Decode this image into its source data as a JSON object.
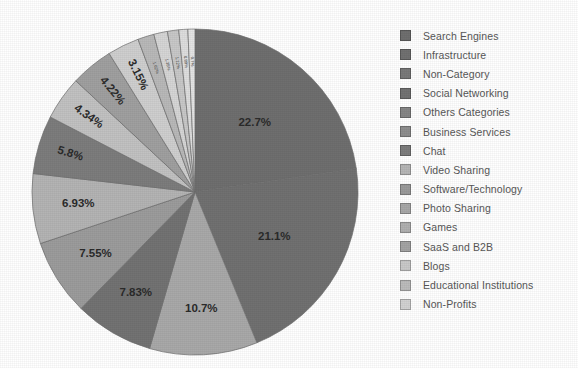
{
  "chart_data": {
    "type": "pie",
    "title": "",
    "xlabel": "",
    "ylabel": "",
    "legend_position": "right",
    "grid": false,
    "start_angle_deg": -90,
    "direction": "clockwise",
    "categories": [
      "Search Engines",
      "Infrastructure",
      "Non-Category",
      "Social Networking",
      "Others Categories",
      "Business Services",
      "Chat",
      "Video Sharing",
      "Software/Technology",
      "Photo Sharing",
      "Games",
      "SaaS and B2B",
      "Blogs",
      "Educational Institutions",
      "Non-Profits"
    ],
    "values": [
      22.7,
      21.1,
      10.7,
      7.83,
      7.55,
      6.93,
      5.8,
      4.34,
      4.22,
      3.15,
      1.62,
      1.35,
      1.12,
      0.89,
      0.7
    ],
    "labels": [
      "22.7%",
      "21.1%",
      "10.7%",
      "7.83%",
      "7.55%",
      "6.93%",
      "5.8%",
      "4.34%",
      "4.22%",
      "3.15%",
      "1.62%",
      "1.35%",
      "1.12%",
      "0.89%",
      "0.7%"
    ],
    "colors": [
      "#6f6f6f",
      "#717171",
      "#a9a9a9",
      "#737373",
      "#9c9c9c",
      "#b4b4b4",
      "#7d7d7d",
      "#c2c2c2",
      "#a0a0a0",
      "#cfcfcf",
      "#b9b9b9",
      "#d6d6d6",
      "#c8c8c8",
      "#dedede",
      "#e4e4e4"
    ],
    "slice_label_visible": [
      true,
      true,
      true,
      true,
      true,
      true,
      true,
      true,
      true,
      true,
      false,
      false,
      false,
      false,
      false
    ]
  },
  "legend": {
    "items": [
      {
        "label": "Search Engines",
        "color": "#6f6f6f"
      },
      {
        "label": "Infrastructure",
        "color": "#717171"
      },
      {
        "label": "Non-Category",
        "color": "#7a7a7a"
      },
      {
        "label": "Social Networking",
        "color": "#737373"
      },
      {
        "label": "Others Categories",
        "color": "#868686"
      },
      {
        "label": "Business Services",
        "color": "#8e8e8e"
      },
      {
        "label": "Chat",
        "color": "#7d7d7d"
      },
      {
        "label": "Video Sharing",
        "color": "#b6b6b6"
      },
      {
        "label": "Software/Technology",
        "color": "#9a9a9a"
      },
      {
        "label": "Photo Sharing",
        "color": "#a8a8a8"
      },
      {
        "label": "Games",
        "color": "#b0b0b0"
      },
      {
        "label": "SaaS and B2B",
        "color": "#a4a4a4"
      },
      {
        "label": "Blogs",
        "color": "#c9c9c9"
      },
      {
        "label": "Educational Institutions",
        "color": "#bcbcbc"
      },
      {
        "label": "Non-Profits",
        "color": "#d2d2d2"
      }
    ]
  }
}
